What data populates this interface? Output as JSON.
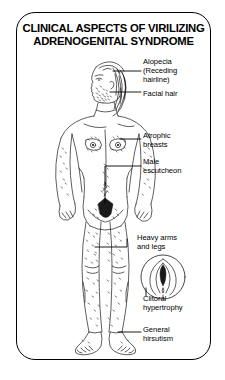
{
  "plate": {
    "title_line_1": "CLINICAL ASPECTS OF VIRILIZING",
    "title_line_2": "ADRENOGENITAL SYNDROME",
    "background_color": "#ffffff",
    "ink_color": "#000000"
  },
  "labels": {
    "alopecia": "Alopecia\n(Receding\nhairline)",
    "facial_hair": "Facial hair",
    "atrophic_breasts": "Atrophic\nbreasts",
    "male_escutcheon": "Male\nescutcheon",
    "heavy_arms_and_legs": "Heavy arms\nand legs",
    "clitoral_hypertrophy": "Clitoral\nhypertrophy",
    "general_hirsutism": "General\nhirsutism"
  },
  "figure": {
    "head": "profile-head-facing-left",
    "inset": "circular-vulva-detail-inset"
  }
}
